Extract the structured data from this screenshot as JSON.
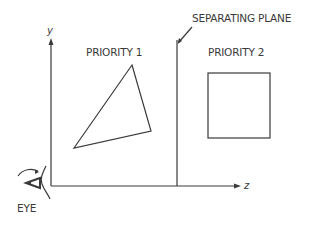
{
  "diagram": {
    "axes": {
      "y_label": "y",
      "z_label": "z"
    },
    "labels": {
      "separating_plane": "SEPARATING PLANE",
      "priority_1": "PRIORITY 1",
      "priority_2": "PRIORITY 2",
      "eye": "EYE"
    },
    "shapes": {
      "triangle": {
        "points": [
          [
            132,
            65
          ],
          [
            151,
            131
          ],
          [
            74,
            148
          ]
        ]
      },
      "square": {
        "x": 208,
        "y": 73,
        "width": 62,
        "height": 65
      },
      "separating_plane_x": 177
    },
    "colors": {
      "stroke": "#3a3a3a",
      "background": "#ffffff"
    }
  }
}
